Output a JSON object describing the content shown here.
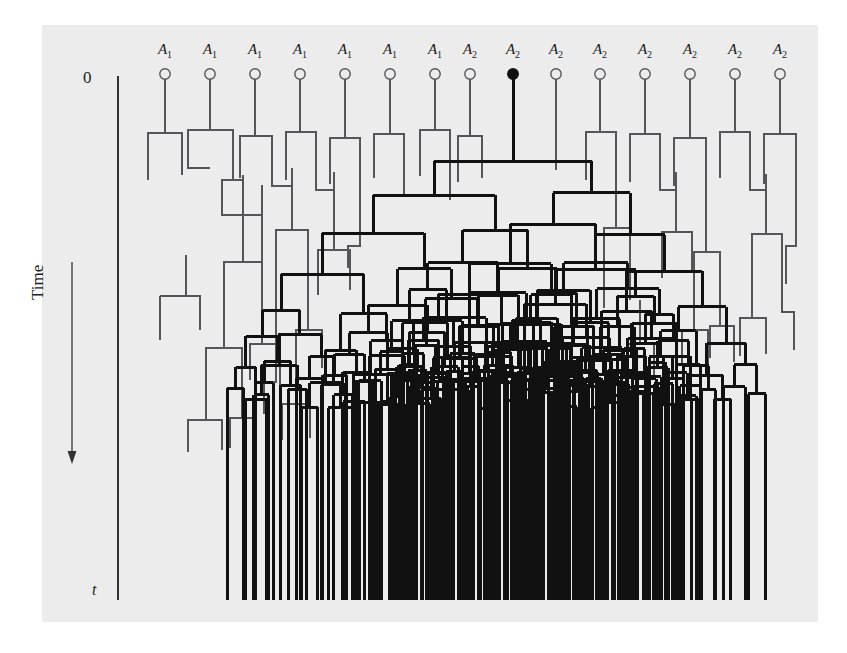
{
  "figure": {
    "kind": "coalescent-genealogy-diagram",
    "panel_background": "#ececec",
    "page_background": "#ffffff",
    "axis": {
      "top_tick_label": "0",
      "bottom_tick_label": "t",
      "axis_title": "Time",
      "axis_direction": "downward",
      "axis_color": "#333333"
    },
    "colors": {
      "faded_lineage": "#55555a",
      "surviving_lineage": "#111111",
      "axis": "#333333",
      "text": "#1a1a1a"
    },
    "line_widths": {
      "faded": 1.3,
      "surviving": 3.0
    },
    "legend_note": "Open circles mark non-surviving founders; the single filled circle marks the founder whose lineage fixes."
  },
  "tips": [
    {
      "index": 0,
      "allele": "A",
      "subscript": "1",
      "x": 165,
      "filled": false,
      "stem_bottom": 125
    },
    {
      "index": 1,
      "allele": "A",
      "subscript": "1",
      "x": 210,
      "filled": false,
      "stem_bottom": 122
    },
    {
      "index": 2,
      "allele": "A",
      "subscript": "1",
      "x": 255,
      "filled": false,
      "stem_bottom": 128
    },
    {
      "index": 3,
      "allele": "A",
      "subscript": "1",
      "x": 300,
      "filled": false,
      "stem_bottom": 124
    },
    {
      "index": 4,
      "allele": "A",
      "subscript": "1",
      "x": 345,
      "filled": false,
      "stem_bottom": 130
    },
    {
      "index": 5,
      "allele": "A",
      "subscript": "1",
      "x": 390,
      "filled": false,
      "stem_bottom": 126
    },
    {
      "index": 6,
      "allele": "A",
      "subscript": "1",
      "x": 435,
      "filled": false,
      "stem_bottom": 122
    },
    {
      "index": 7,
      "allele": "A",
      "subscript": "2",
      "x": 470,
      "filled": false,
      "stem_bottom": 128
    },
    {
      "index": 8,
      "allele": "A",
      "subscript": "2",
      "x": 513,
      "filled": true,
      "stem_bottom": 112
    },
    {
      "index": 9,
      "allele": "A",
      "subscript": "2",
      "x": 556,
      "filled": false,
      "stem_bottom": 160
    },
    {
      "index": 10,
      "allele": "A",
      "subscript": "2",
      "x": 600,
      "filled": false,
      "stem_bottom": 124
    },
    {
      "index": 11,
      "allele": "A",
      "subscript": "2",
      "x": 645,
      "filled": false,
      "stem_bottom": 126
    },
    {
      "index": 12,
      "allele": "A",
      "subscript": "2",
      "x": 690,
      "filled": false,
      "stem_bottom": 130
    },
    {
      "index": 13,
      "allele": "A",
      "subscript": "2",
      "x": 735,
      "filled": false,
      "stem_bottom": 124
    },
    {
      "index": 14,
      "allele": "A",
      "subscript": "2",
      "x": 780,
      "filled": false,
      "stem_bottom": 126
    }
  ],
  "tip_circle": {
    "cy": 74,
    "r": 5.2
  },
  "geometry": {
    "panel": {
      "x": 42,
      "y": 25,
      "w": 776,
      "h": 597
    },
    "axis_x": 118,
    "axis_top_y": 76,
    "axis_bottom_y": 600,
    "time_arrow": {
      "x": 72,
      "y_start": 262,
      "y_end": 462
    },
    "tree_bottom_y": 600
  },
  "chart_data": {
    "type": "diagram",
    "n_founders": 15,
    "n_allele_A1": 7,
    "n_allele_A2": 8,
    "surviving_founder_index": 8,
    "surviving_founder_allele": "A2",
    "xlabel": "",
    "ylabel": "Time",
    "ylim": [
      "0",
      "t"
    ],
    "grid": false,
    "legend": []
  }
}
